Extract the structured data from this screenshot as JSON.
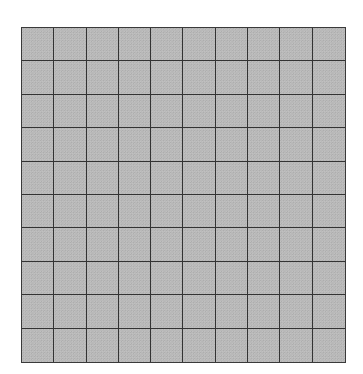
{
  "grid": {
    "rows": 10,
    "columns": 10,
    "cell_fill_color": "#b9b9b9",
    "line_color": "#333333",
    "background_color": "#ffffff"
  }
}
